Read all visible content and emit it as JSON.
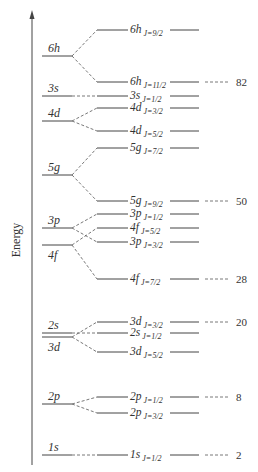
{
  "diagram": {
    "axis": {
      "label": "Energy",
      "direction": "up"
    },
    "colors": {
      "line": "#444444",
      "text": "#333333",
      "background": "#ffffff"
    },
    "unsplit_levels": [
      {
        "id": "6h",
        "label": "6h",
        "y": 56
      },
      {
        "id": "3s",
        "label": "3s",
        "y": 96
      },
      {
        "id": "4d",
        "label": "4d",
        "y": 121
      },
      {
        "id": "5g",
        "label": "5g",
        "y": 175
      },
      {
        "id": "3p",
        "label": "3p",
        "y": 228
      },
      {
        "id": "4f",
        "label": "4f",
        "y": 245,
        "label_below": true
      },
      {
        "id": "2s",
        "label": "2s",
        "y": 333
      },
      {
        "id": "3d",
        "label": "3d",
        "y": 337,
        "label_below": true
      },
      {
        "id": "2p",
        "label": "2p",
        "y": 404
      },
      {
        "id": "1s",
        "label": "1s",
        "y": 455
      }
    ],
    "split_levels": [
      {
        "parent": "6h",
        "orbital": "6h",
        "j": "J=9/2",
        "y": 30
      },
      {
        "parent": "6h",
        "orbital": "6h",
        "j": "J=11/2",
        "y": 82,
        "magic": "82"
      },
      {
        "parent": "3s",
        "orbital": "3s",
        "j": "J=1/2",
        "y": 96
      },
      {
        "parent": "4d",
        "orbital": "4d",
        "j": "J=3/2",
        "y": 108
      },
      {
        "parent": "4d",
        "orbital": "4d",
        "j": "J=5/2",
        "y": 131
      },
      {
        "parent": "5g",
        "orbital": "5g",
        "j": "J=7/2",
        "y": 148
      },
      {
        "parent": "5g",
        "orbital": "5g",
        "j": "J=9/2",
        "y": 201,
        "magic": "50"
      },
      {
        "parent": "3p",
        "orbital": "3p",
        "j": "J=1/2",
        "y": 214
      },
      {
        "parent": "4f",
        "orbital": "4f",
        "j": "J=5/2",
        "y": 228
      },
      {
        "parent": "3p",
        "orbital": "3p",
        "j": "J=3/2",
        "y": 242
      },
      {
        "parent": "4f",
        "orbital": "4f",
        "j": "J=7/2",
        "y": 279,
        "magic": "28"
      },
      {
        "parent": "3d",
        "orbital": "3d",
        "j": "J=3/2",
        "y": 322,
        "magic": "20"
      },
      {
        "parent": "2s",
        "orbital": "2s",
        "j": "J=1/2",
        "y": 333
      },
      {
        "parent": "3d",
        "orbital": "3d",
        "j": "J=5/2",
        "y": 352
      },
      {
        "parent": "2p",
        "orbital": "2p",
        "j": "J=1/2",
        "y": 397,
        "magic": "8"
      },
      {
        "parent": "2p",
        "orbital": "2p",
        "j": "J=3/2",
        "y": 413
      },
      {
        "parent": "1s",
        "orbital": "1s",
        "j": "J=1/2",
        "y": 455,
        "magic": "2"
      }
    ],
    "magic_numbers": [
      "82",
      "50",
      "28",
      "20",
      "8",
      "2"
    ]
  }
}
